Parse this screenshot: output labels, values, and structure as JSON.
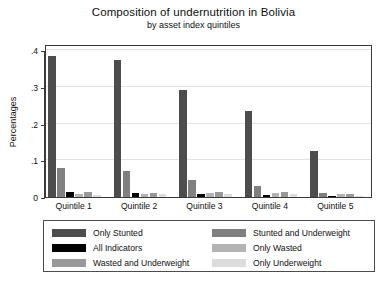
{
  "chart_data": {
    "type": "bar",
    "title": "Composition of undernutrition in Bolivia",
    "subtitle": "by asset index quintiles",
    "xlabel": "",
    "ylabel": "Percentages",
    "categories": [
      "Quintile 1",
      "Quintile 2",
      "Quintile 3",
      "Quintile 4",
      "Quintile 5"
    ],
    "ylim": [
      0,
      0.4
    ],
    "yticks": [
      0,
      0.1,
      0.2,
      0.3,
      0.4
    ],
    "ytick_labels": [
      "0",
      ".1",
      ".2",
      ".3",
      ".4"
    ],
    "grid": true,
    "legend_position": "bottom",
    "series": [
      {
        "name": "Only Stunted",
        "color": "#4d4d4d",
        "values": [
          0.383,
          0.372,
          0.291,
          0.233,
          0.126
        ]
      },
      {
        "name": "Stunted and Underweight",
        "color": "#808080",
        "values": [
          0.078,
          0.071,
          0.046,
          0.029,
          0.012
        ]
      },
      {
        "name": "All Indicators",
        "color": "#000000",
        "values": [
          0.015,
          0.012,
          0.009,
          0.006,
          0.002
        ]
      },
      {
        "name": "Only Wasted",
        "color": "#b3b3b3",
        "values": [
          0.009,
          0.008,
          0.011,
          0.01,
          0.008
        ]
      },
      {
        "name": "Wasted and Underweight",
        "color": "#999999",
        "values": [
          0.014,
          0.011,
          0.013,
          0.013,
          0.009
        ]
      },
      {
        "name": "Only Underweight",
        "color": "#dcdcdc",
        "values": [
          0.006,
          0.008,
          0.008,
          0.007,
          0.004
        ]
      }
    ]
  },
  "legend": {
    "left_column": [
      {
        "label": "Only Stunted",
        "color": "#4d4d4d"
      },
      {
        "label": "All Indicators",
        "color": "#000000"
      },
      {
        "label": "Wasted and Underweight",
        "color": "#999999"
      }
    ],
    "right_column": [
      {
        "label": "Stunted and Underweight",
        "color": "#808080"
      },
      {
        "label": "Only Wasted",
        "color": "#b3b3b3"
      },
      {
        "label": "Only Underweight",
        "color": "#dcdcdc"
      }
    ]
  },
  "colors": {
    "axis": "#3a3a3a",
    "grid": "#e2e2e2",
    "frame": "#3a3a3a",
    "legend_border": "#4c4c4c",
    "background": "#ffffff"
  }
}
